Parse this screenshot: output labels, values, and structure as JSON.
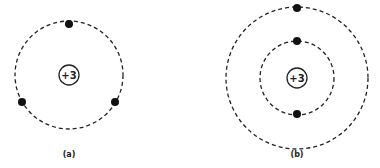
{
  "diagrams": [
    {
      "id": "a",
      "caption": "(a)",
      "nucleus_charge": "+3",
      "center": [
        69,
        75
      ],
      "nucleus_radius": 10,
      "orbits": [
        54
      ],
      "electrons": [
        [
          69,
          24
        ],
        [
          22,
          102
        ],
        [
          115,
          102
        ]
      ]
    },
    {
      "id": "b",
      "caption": "(b)",
      "nucleus_charge": "+3",
      "center": [
        297,
        78
      ],
      "nucleus_radius": 10,
      "orbits": [
        37,
        71
      ],
      "electrons": [
        [
          297,
          8
        ],
        [
          297,
          41
        ],
        [
          297,
          114
        ]
      ]
    }
  ],
  "colors": {
    "line": "#222222",
    "electron": "#111111",
    "background": "#ffffff"
  }
}
